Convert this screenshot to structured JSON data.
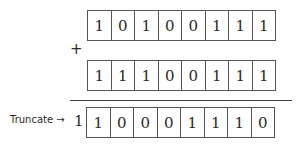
{
  "operator": "+",
  "operand_a": [
    "1",
    "0",
    "1",
    "0",
    "0",
    "1",
    "1",
    "1"
  ],
  "operand_b": [
    "1",
    "1",
    "1",
    "0",
    "0",
    "1",
    "1",
    "1"
  ],
  "result": [
    "1",
    "0",
    "0",
    "0",
    "1",
    "1",
    "1",
    "0"
  ],
  "carry_bit": "1",
  "truncate_label": "Truncate →"
}
